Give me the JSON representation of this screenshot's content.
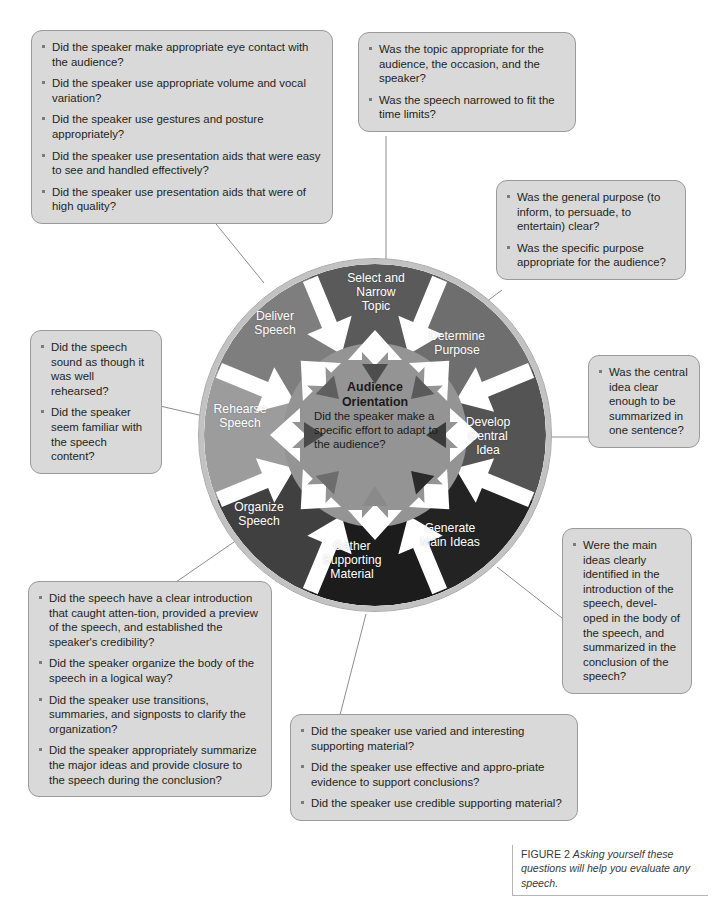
{
  "figure": {
    "label": "FIGURE 2",
    "text": "Asking yourself these questions will help you evaluate any speech."
  },
  "wheel": {
    "center": {
      "title_line1": "Audience",
      "title_line2": "Orientation",
      "question": "Did the speaker make a specific effort to adapt to the audience?"
    },
    "segments": [
      {
        "id": "select-narrow-topic",
        "label_line1": "Select and",
        "label_line2": "Narrow",
        "label_line3": "Topic",
        "color": "#5a5a5a"
      },
      {
        "id": "determine-purpose",
        "label_line1": "Determine",
        "label_line2": "Purpose",
        "label_line3": "",
        "color": "#6e6e6e"
      },
      {
        "id": "develop-central-idea",
        "label_line1": "Develop",
        "label_line2": "Central",
        "label_line3": "Idea",
        "color": "#545454"
      },
      {
        "id": "generate-main-ideas",
        "label_line1": "Generate",
        "label_line2": "Main Ideas",
        "label_line3": "",
        "color": "#222222"
      },
      {
        "id": "gather-supporting-material",
        "label_line1": "Gather",
        "label_line2": "Supporting",
        "label_line3": "Material",
        "color": "#1b1b1b"
      },
      {
        "id": "organize-speech",
        "label_line1": "Organize",
        "label_line2": "Speech",
        "label_line3": "",
        "color": "#3f3f3f"
      },
      {
        "id": "rehearse-speech",
        "label_line1": "Rehearse",
        "label_line2": "Speech",
        "label_line3": "",
        "color": "#9a9a9a"
      },
      {
        "id": "deliver-speech",
        "label_line1": "Deliver",
        "label_line2": "Speech",
        "label_line3": "",
        "color": "#7d7d7d"
      }
    ]
  },
  "callouts": {
    "deliver_speech": {
      "id": "callout-deliver-speech",
      "items": [
        "Did the speaker make appropriate eye contact with the audience?",
        "Did the speaker use appropriate volume and vocal variation?",
        "Did the speaker use gestures  and posture appropriately?",
        "Did the speaker use presentation aids that were easy to see and handled effectively?",
        "Did the speaker use presentation aids that were of high quality?"
      ]
    },
    "select_narrow_topic": {
      "id": "callout-select-narrow-topic",
      "items": [
        "Was the topic appropriate for the audience, the occasion, and the speaker?",
        "Was the speech narrowed to fit the time limits?"
      ]
    },
    "determine_purpose": {
      "id": "callout-determine-purpose",
      "items": [
        "Was the general purpose (to inform, to persuade, to entertain) clear?",
        "Was the specific purpose appropriate for the audience?"
      ]
    },
    "develop_central_idea": {
      "id": "callout-develop-central-idea",
      "items": [
        "Was the central idea clear enough to be summarized in one sentence?"
      ]
    },
    "generate_main_ideas": {
      "id": "callout-generate-main-ideas",
      "items": [
        "Were the main ideas clearly identified in the introduction of the speech, devel-oped in the body of the speech, and summarized in the conclusion of the speech?"
      ]
    },
    "gather_supporting_material": {
      "id": "callout-gather-supporting-material",
      "items": [
        "Did the speaker use varied and interesting supporting material?",
        "Did the speaker use effective and appro-priate evidence to support conclusions?",
        "Did the speaker use credible supporting material?"
      ]
    },
    "organize_speech": {
      "id": "callout-organize-speech",
      "items": [
        "Did the speech have a clear introduction that caught atten-tion, provided a preview of the speech, and established the speaker's credibility?",
        "Did the speaker organize the body of the speech in a logical way?",
        "Did the speaker use transitions, summaries, and signposts to clarify the organization?",
        "Did the speaker appropriately summarize the major ideas and provide closure to the speech during the conclusion?"
      ]
    },
    "rehearse_speech": {
      "id": "callout-rehearse-speech",
      "items": [
        "Did the speech sound as though it was well rehearsed?",
        "Did the speaker seem familiar with the speech content?"
      ]
    }
  },
  "colors": {
    "callout_fill": "#d9d9d9",
    "callout_border": "#9a9a9a",
    "wheel_rim": "#c8c8c8",
    "arrow_white": "#ffffff",
    "text": "#231f20"
  }
}
